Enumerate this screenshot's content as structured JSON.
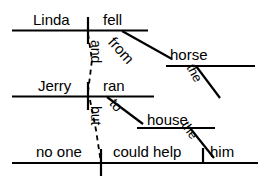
{
  "diagram": {
    "type": "sentence-diagram",
    "style": "Reed-Kellogg",
    "sentence": "Linda fell from the horse and Jerry ran to the house but no one could help him",
    "stroke_color": "#000000",
    "background_color": "#ffffff",
    "clauses": [
      {
        "id": "clause-1",
        "subject": "Linda",
        "verb": "fell",
        "modifiers": [
          {
            "word": "from",
            "type": "preposition",
            "slant": "down-right"
          },
          {
            "word": "horse",
            "type": "object-of-preposition"
          },
          {
            "word": "the",
            "type": "article",
            "slant": "down-right"
          }
        ]
      },
      {
        "id": "clause-2",
        "subject": "Jerry",
        "verb": "ran",
        "modifiers": [
          {
            "word": "to",
            "type": "preposition",
            "slant": "down-right"
          },
          {
            "word": "house",
            "type": "object-of-preposition"
          },
          {
            "word": "the",
            "type": "article",
            "slant": "down-right"
          }
        ]
      },
      {
        "id": "clause-3",
        "subject": "no one",
        "verb": "could help",
        "modifiers": [
          {
            "word": "him",
            "type": "direct-object"
          }
        ]
      }
    ],
    "conjunctions": [
      {
        "word": "and",
        "connects": "clause-1-to-clause-2",
        "line_style": "dashed",
        "orientation": "vertical"
      },
      {
        "word": "but",
        "connects": "clause-2-to-clause-3",
        "line_style": "dashed",
        "orientation": "vertical"
      }
    ],
    "labels": {
      "linda": "Linda",
      "fell": "fell",
      "from": "from",
      "the_horse_article": "the",
      "horse": "horse",
      "and": "and",
      "jerry": "Jerry",
      "ran": "ran",
      "to": "to",
      "the_house_article": "the",
      "house": "house",
      "but": "but",
      "no_one": "no one",
      "could_help": "could help",
      "him": "him"
    }
  }
}
